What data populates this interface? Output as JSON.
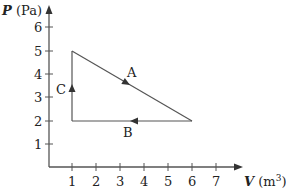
{
  "diagram": {
    "y_axis": {
      "symbol": "P",
      "unit": "(Pa)",
      "ticks": [
        "1",
        "2",
        "3",
        "4",
        "5",
        "6"
      ]
    },
    "x_axis": {
      "symbol": "V",
      "unit": "(m",
      "unit_sup": "3",
      "unit_close": ")",
      "ticks": [
        "1",
        "2",
        "3",
        "4",
        "5",
        "6",
        "7"
      ]
    },
    "paths": [
      {
        "label": "A",
        "from": [
          1,
          5
        ],
        "to": [
          6,
          2
        ]
      },
      {
        "label": "B",
        "from": [
          6,
          2
        ],
        "to": [
          1,
          2
        ]
      },
      {
        "label": "C",
        "from": [
          1,
          2
        ],
        "to": [
          1,
          5
        ]
      }
    ],
    "line_color": "#555555",
    "text_color": "#222222"
  }
}
